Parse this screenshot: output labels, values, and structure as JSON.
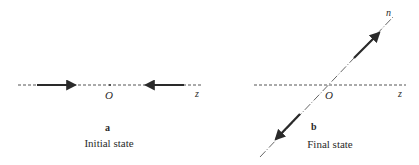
{
  "figure": {
    "panels": [
      {
        "id": "a",
        "letter": "a",
        "caption": "Initial state",
        "axis_label": "z",
        "origin_label": "O"
      },
      {
        "id": "b",
        "letter": "b",
        "caption": "Final state",
        "axis_label": "z",
        "direction_label": "n",
        "origin_label": "O"
      }
    ],
    "colors": {
      "line": "#555555",
      "arrow": "#2a2a2a",
      "text": "#2a2a2a"
    }
  }
}
